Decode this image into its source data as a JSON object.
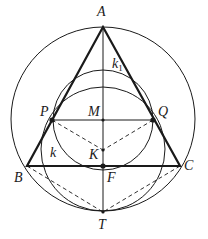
{
  "figure": {
    "width": 208,
    "height": 239,
    "stroke_color": "#1a1a1a",
    "background": "#ffffff"
  },
  "points": {
    "A": {
      "label": "A",
      "x": 103,
      "y": 27
    },
    "B": {
      "label": "B",
      "x": 27,
      "y": 166
    },
    "C": {
      "label": "C",
      "x": 180,
      "y": 166
    },
    "P": {
      "label": "P",
      "x": 52,
      "y": 120
    },
    "Q": {
      "label": "Q",
      "x": 153,
      "y": 120
    },
    "M": {
      "label": "M",
      "x": 103,
      "y": 120
    },
    "K": {
      "label": "K",
      "x": 103,
      "y": 150
    },
    "F": {
      "label": "F",
      "x": 103,
      "y": 166
    },
    "T": {
      "label": "T",
      "x": 103,
      "y": 212
    }
  },
  "circles": {
    "circumcircle": {
      "cx": 103,
      "cy": 119,
      "r": 92
    },
    "k": {
      "label": "k",
      "cx": 103,
      "cy": 149,
      "r": 62
    },
    "k1": {
      "label": "k",
      "subscript": "1",
      "cx": 103,
      "cy": 120,
      "r": 50
    }
  },
  "labels": {
    "A": "A",
    "B": "B",
    "C": "C",
    "P": "P",
    "Q": "Q",
    "M": "M",
    "K": "K",
    "F": "F",
    "T": "T",
    "k": "k",
    "k1_main": "k",
    "k1_sub": "1"
  }
}
